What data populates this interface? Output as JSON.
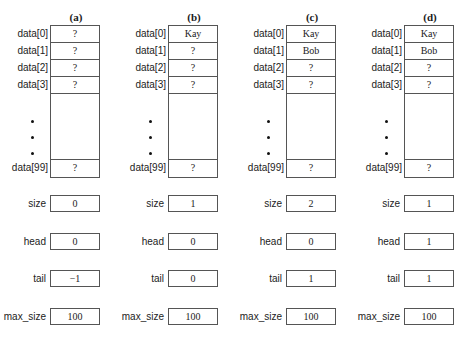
{
  "diagram": {
    "row_labels": [
      "data[0]",
      "data[1]",
      "data[2]",
      "data[3]",
      "data[99]"
    ],
    "variable_labels": {
      "size": "size",
      "head": "head",
      "tail": "tail",
      "max_size": "max_size"
    },
    "columns": [
      {
        "header": "(a)",
        "cells": [
          "?",
          "?",
          "?",
          "?",
          "?"
        ],
        "size": "0",
        "head": "0",
        "tail": "−1",
        "max_size": "100"
      },
      {
        "header": "(b)",
        "cells": [
          "Kay",
          "?",
          "?",
          "?",
          "?"
        ],
        "size": "1",
        "head": "0",
        "tail": "0",
        "max_size": "100"
      },
      {
        "header": "(c)",
        "cells": [
          "Kay",
          "Bob",
          "?",
          "?",
          "?"
        ],
        "size": "2",
        "head": "0",
        "tail": "1",
        "max_size": "100"
      },
      {
        "header": "(d)",
        "cells": [
          "Kay",
          "Bob",
          "?",
          "?",
          "?"
        ],
        "size": "1",
        "head": "1",
        "tail": "1",
        "max_size": "100"
      }
    ]
  }
}
